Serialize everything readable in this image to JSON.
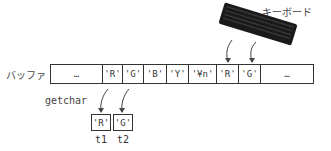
{
  "labels": {
    "buffer": "バッファ",
    "keyboard": "キーボード",
    "getchar": "getchar"
  },
  "buffer_cells": [
    {
      "text": "…",
      "width": 52
    },
    {
      "text": "'R'",
      "width": 20
    },
    {
      "text": "'G'",
      "width": 21
    },
    {
      "text": "'B'",
      "width": 23
    },
    {
      "text": "'Y'",
      "width": 22
    },
    {
      "text": "'¥n'",
      "width": 28
    },
    {
      "text": "'R'",
      "width": 22
    },
    {
      "text": "'G'",
      "width": 22
    },
    {
      "text": "…",
      "width": 52
    }
  ],
  "variables": [
    {
      "name": "t1",
      "value": "'R'"
    },
    {
      "name": "t2",
      "value": "'G'"
    }
  ]
}
